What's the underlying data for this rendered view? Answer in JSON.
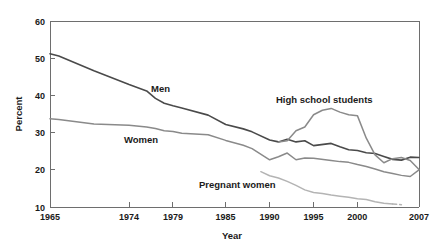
{
  "figure": {
    "clipped_title": "Cigarette smoking",
    "title_visible": false
  },
  "axes": {
    "ylabel": "Percent",
    "xlabel": "Year",
    "y_ticks": [
      "10",
      "20",
      "30",
      "40",
      "50",
      "60"
    ],
    "x_ticks": [
      "1965",
      "1974",
      "1979",
      "1985",
      "1990",
      "1995",
      "2000",
      "2007"
    ]
  },
  "labels": {
    "men": "Men",
    "women": "Women",
    "high_school_students": "High school students",
    "pregnant_women": "Pregnant women"
  },
  "colors": {
    "men": "#4a4a4a",
    "women": "#8a8a8a",
    "high_school_students": "#8a8a8a",
    "pregnant_women": "#b4b4b4",
    "axis": "#6e6e6e",
    "text": "#1a1a1a",
    "background": "#ffffff"
  },
  "chart_data": {
    "type": "line",
    "title": "Cigarette smoking",
    "xlabel": "Year",
    "ylabel": "Percent",
    "xlim": [
      1965,
      2007
    ],
    "ylim": [
      10,
      60
    ],
    "ytick_values": [
      10,
      20,
      30,
      40,
      50,
      60
    ],
    "xtick_values": [
      1965,
      1974,
      1979,
      1985,
      1990,
      1995,
      2000,
      2007
    ],
    "grid": false,
    "legend": "inline-annotations",
    "series": [
      {
        "name": "Men",
        "color": "#4a4a4a",
        "x": [
          1965,
          1966,
          1970,
          1974,
          1976,
          1977,
          1978,
          1979,
          1980,
          1983,
          1985,
          1987,
          1988,
          1990,
          1991,
          1992,
          1993,
          1994,
          1995,
          1997,
          1998,
          1999,
          2000,
          2001,
          2002,
          2003,
          2004,
          2005,
          2006,
          2007
        ],
        "y": [
          51.2,
          50.6,
          46.6,
          42.9,
          41.2,
          39.2,
          37.9,
          37.2,
          36.6,
          34.7,
          32.2,
          31.0,
          30.2,
          28.0,
          27.5,
          28.2,
          27.5,
          27.8,
          26.5,
          27.1,
          26.2,
          25.4,
          25.2,
          24.6,
          24.4,
          23.6,
          22.8,
          22.6,
          23.4,
          23.3
        ],
        "note": "Peaks at 51.2 in 1965, falls steadily"
      },
      {
        "name": "Women",
        "color": "#8a8a8a",
        "x": [
          1965,
          1966,
          1970,
          1974,
          1976,
          1977,
          1978,
          1979,
          1980,
          1983,
          1985,
          1987,
          1988,
          1990,
          1991,
          1992,
          1993,
          1994,
          1995,
          1997,
          1998,
          1999,
          2000,
          2001,
          2002,
          2003,
          2004,
          2005,
          2006,
          2007
        ],
        "y": [
          33.7,
          33.5,
          32.3,
          32.0,
          31.5,
          31.1,
          30.5,
          30.3,
          29.8,
          29.4,
          27.9,
          26.6,
          25.7,
          22.7,
          23.5,
          24.5,
          22.7,
          23.2,
          23.1,
          22.5,
          22.2,
          22.0,
          21.4,
          20.9,
          20.2,
          19.5,
          19.0,
          18.5,
          18.2,
          20.0
        ],
        "note": "Lower and flatter decline than Men"
      },
      {
        "name": "High school students",
        "color": "#8a8a8a",
        "x": [
          1991,
          1992,
          1993,
          1994,
          1995,
          1996,
          1997,
          1998,
          1999,
          2000,
          2001,
          2002,
          2003,
          2004,
          2005,
          2006,
          2007
        ],
        "y": [
          27.5,
          27.8,
          30.5,
          31.5,
          34.8,
          36.0,
          36.5,
          35.5,
          34.8,
          34.5,
          28.5,
          24.0,
          21.9,
          23.0,
          23.3,
          22.5,
          20.1
        ],
        "note": "Rises to peak 36.5 in 1997 then falls sharply"
      },
      {
        "name": "Pregnant women",
        "color": "#b4b4b4",
        "x": [
          1989,
          1990,
          1991,
          1992,
          1993,
          1994,
          1995,
          1996,
          1997,
          1998,
          1999,
          2000,
          2001,
          2002,
          2003,
          2004,
          2005
        ],
        "y": [
          19.5,
          18.4,
          17.8,
          16.9,
          15.8,
          14.6,
          13.9,
          13.6,
          13.2,
          12.9,
          12.6,
          12.2,
          12.0,
          11.4,
          11.0,
          10.8,
          10.6
        ],
        "note": "Shortest series, begins 1989, dashed at end"
      }
    ]
  }
}
